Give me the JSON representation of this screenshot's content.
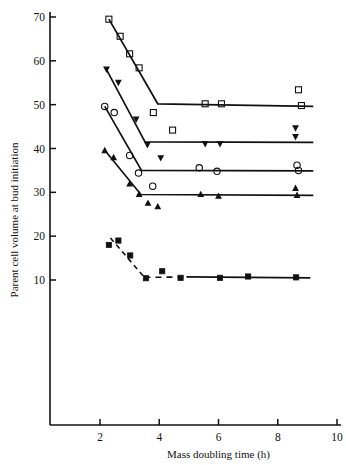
{
  "chart_data": {
    "type": "scatter",
    "title": "",
    "xlabel": "Mass doubling time (h)",
    "ylabel": "Parent cell volume at bud initiation",
    "xlim": [
      1.0,
      10.0
    ],
    "ylim": [
      5.0,
      72.0
    ],
    "xticks": [
      2,
      4,
      6,
      8,
      10
    ],
    "yticks": [
      10,
      20,
      30,
      40,
      50,
      60,
      70
    ],
    "xtick_labels": [
      "2",
      "4",
      "6",
      "8",
      "10"
    ],
    "ytick_labels": [
      "10",
      "20",
      "30",
      "40",
      "50",
      "60",
      "70"
    ],
    "grid": false,
    "legend": "none",
    "series": [
      {
        "name": "series-1-open-square",
        "marker": "open-square",
        "line_style": "solid",
        "points": [
          {
            "x": 2.3,
            "y": 69.5
          },
          {
            "x": 2.68,
            "y": 65.6
          },
          {
            "x": 3.0,
            "y": 61.6
          },
          {
            "x": 3.32,
            "y": 58.4
          },
          {
            "x": 3.8,
            "y": 48.2
          },
          {
            "x": 4.45,
            "y": 44.2
          },
          {
            "x": 5.55,
            "y": 50.2
          },
          {
            "x": 6.1,
            "y": 50.2
          },
          {
            "x": 8.7,
            "y": 53.4
          },
          {
            "x": 8.8,
            "y": 49.8
          }
        ],
        "fit_line": [
          {
            "x": 2.3,
            "y": 69.5
          },
          {
            "x": 3.95,
            "y": 50.2
          },
          {
            "x": 9.2,
            "y": 49.6
          }
        ]
      },
      {
        "name": "series-2-filled-down-triangle",
        "marker": "filled-down-triangle",
        "line_style": "solid",
        "points": [
          {
            "x": 2.22,
            "y": 58.0
          },
          {
            "x": 2.62,
            "y": 55.0
          },
          {
            "x": 3.22,
            "y": 46.6
          },
          {
            "x": 3.6,
            "y": 40.8
          },
          {
            "x": 4.05,
            "y": 37.8
          },
          {
            "x": 5.55,
            "y": 41.0
          },
          {
            "x": 6.05,
            "y": 41.0
          },
          {
            "x": 8.6,
            "y": 44.6
          },
          {
            "x": 8.6,
            "y": 42.6
          }
        ],
        "fit_line": [
          {
            "x": 2.22,
            "y": 58.0
          },
          {
            "x": 3.52,
            "y": 41.5
          },
          {
            "x": 9.2,
            "y": 41.4
          }
        ]
      },
      {
        "name": "series-3-open-circle",
        "marker": "open-circle",
        "line_style": "solid",
        "points": [
          {
            "x": 2.16,
            "y": 49.6
          },
          {
            "x": 2.48,
            "y": 48.2
          },
          {
            "x": 3.0,
            "y": 38.4
          },
          {
            "x": 3.3,
            "y": 34.4
          },
          {
            "x": 3.78,
            "y": 31.4
          },
          {
            "x": 5.35,
            "y": 35.6
          },
          {
            "x": 5.95,
            "y": 34.8
          },
          {
            "x": 8.65,
            "y": 36.2
          },
          {
            "x": 8.7,
            "y": 35.0
          }
        ],
        "fit_line": [
          {
            "x": 2.16,
            "y": 49.6
          },
          {
            "x": 3.4,
            "y": 35.0
          },
          {
            "x": 9.2,
            "y": 34.9
          }
        ]
      },
      {
        "name": "series-4-filled-up-triangle",
        "marker": "filled-up-triangle",
        "line_style": "solid",
        "points": [
          {
            "x": 2.16,
            "y": 39.6
          },
          {
            "x": 2.46,
            "y": 38.0
          },
          {
            "x": 3.0,
            "y": 32.0
          },
          {
            "x": 3.32,
            "y": 29.6
          },
          {
            "x": 3.62,
            "y": 27.6
          },
          {
            "x": 3.95,
            "y": 26.8
          },
          {
            "x": 5.4,
            "y": 29.6
          },
          {
            "x": 6.0,
            "y": 29.2
          },
          {
            "x": 8.6,
            "y": 31.0
          },
          {
            "x": 8.65,
            "y": 29.4
          }
        ],
        "fit_line": [
          {
            "x": 2.16,
            "y": 39.6
          },
          {
            "x": 3.38,
            "y": 29.5
          },
          {
            "x": 9.2,
            "y": 29.3
          }
        ]
      },
      {
        "name": "series-5-filled-square",
        "marker": "filled-square",
        "line_style": "dashed-then-solid",
        "points": [
          {
            "x": 2.3,
            "y": 18.0
          },
          {
            "x": 2.62,
            "y": 19.0
          },
          {
            "x": 3.02,
            "y": 15.6
          },
          {
            "x": 3.55,
            "y": 10.4
          },
          {
            "x": 4.1,
            "y": 12.0
          },
          {
            "x": 4.72,
            "y": 10.5
          },
          {
            "x": 6.05,
            "y": 10.5
          },
          {
            "x": 7.0,
            "y": 10.8
          },
          {
            "x": 8.62,
            "y": 10.6
          }
        ],
        "fit_line": [
          {
            "x": 2.35,
            "y": 19.6
          },
          {
            "x": 3.5,
            "y": 10.6
          },
          {
            "x": 9.1,
            "y": 10.5
          }
        ]
      }
    ]
  },
  "colors": {
    "ink": "#111111",
    "background": "#ffffff"
  }
}
